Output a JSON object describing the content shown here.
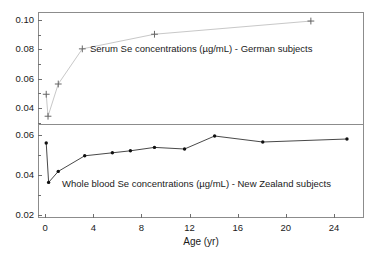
{
  "figure": {
    "width": 371,
    "height": 255,
    "background": "#ffffff"
  },
  "axis": {
    "x_title": "Age (yr)",
    "x_ticks": [
      "0",
      "4",
      "8",
      "12",
      "16",
      "20",
      "24"
    ],
    "x_tick_values": [
      0,
      4,
      8,
      12,
      16,
      20,
      24
    ],
    "x_min": -0.6,
    "x_max": 26.5,
    "top_y_ticks": [
      "0.04",
      "0.06",
      "0.08",
      "0.10"
    ],
    "top_y_tick_values": [
      0.04,
      0.06,
      0.08,
      0.1
    ],
    "top_y_min": 0.029,
    "top_y_max": 0.1055,
    "bottom_y_ticks": [
      "0.02",
      "0.04",
      "0.06"
    ],
    "bottom_y_tick_values": [
      0.02,
      0.04,
      0.06
    ],
    "bottom_y_min": 0.0185,
    "bottom_y_max": 0.0655
  },
  "annotations": {
    "serum": "Serum Se concentrations (µg/mL) - German subjects",
    "blood": "Whole blood Se concentrations (µg/mL) - New Zealand subjects"
  },
  "colors": {
    "serum_line": "#c8c8c8",
    "serum_marker": "#666666",
    "blood_line": "#333333",
    "blood_marker": "#111111",
    "frame": "#8c8c8c",
    "text": "#1a1a1a"
  },
  "chart_data": [
    {
      "type": "line",
      "panel": "top",
      "title": "Serum Se concentrations (µg/mL) - German subjects",
      "xlabel": "Age (yr)",
      "ylabel": "",
      "marker": "plus",
      "xlim": [
        -0.6,
        26.5
      ],
      "ylim": [
        0.029,
        0.1055
      ],
      "grid": false,
      "legend": "none",
      "x": [
        0.0,
        0.15,
        1.0,
        3.0,
        9.0,
        22.0
      ],
      "y": [
        0.05,
        0.035,
        0.057,
        0.081,
        0.091,
        0.1
      ],
      "series": [
        {
          "name": "Serum Se - German subjects",
          "x": [
            0.0,
            0.15,
            1.0,
            3.0,
            9.0,
            22.0
          ],
          "values": [
            0.05,
            0.035,
            0.057,
            0.081,
            0.091,
            0.1
          ]
        }
      ]
    },
    {
      "type": "line",
      "panel": "bottom",
      "title": "Whole blood Se concentrations (µg/mL) - New Zealand subjects",
      "xlabel": "Age (yr)",
      "ylabel": "",
      "marker": "dot",
      "xlim": [
        -0.6,
        26.5
      ],
      "ylim": [
        0.0185,
        0.0655
      ],
      "grid": false,
      "legend": "none",
      "x": [
        0.0,
        0.2,
        1.0,
        3.2,
        5.5,
        7.0,
        9.0,
        11.5,
        14.0,
        18.0,
        25.0
      ],
      "y": [
        0.0565,
        0.0368,
        0.0423,
        0.0501,
        0.0516,
        0.0526,
        0.0543,
        0.0535,
        0.06,
        0.057,
        0.0585
      ],
      "series": [
        {
          "name": "Whole blood Se - New Zealand subjects",
          "x": [
            0.0,
            0.2,
            1.0,
            3.2,
            5.5,
            7.0,
            9.0,
            11.5,
            14.0,
            18.0,
            25.0
          ],
          "values": [
            0.0565,
            0.0368,
            0.0423,
            0.0501,
            0.0516,
            0.0526,
            0.0543,
            0.0535,
            0.06,
            0.057,
            0.0585
          ]
        }
      ]
    }
  ]
}
